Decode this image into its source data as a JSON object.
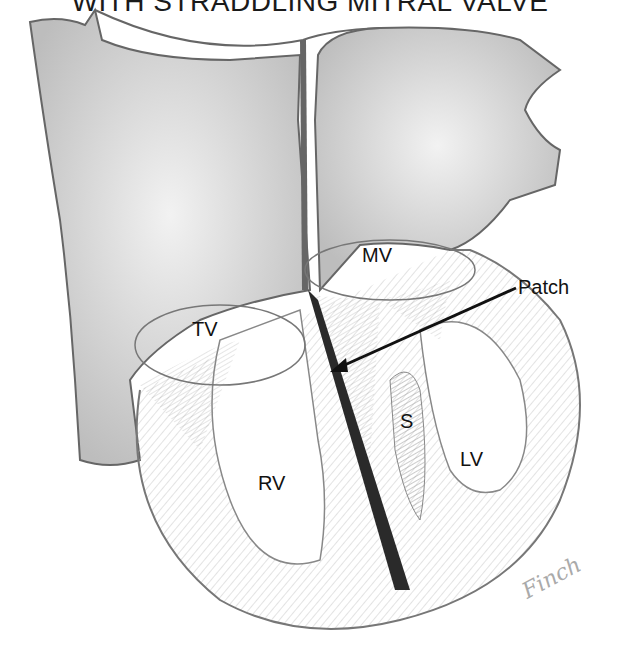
{
  "title": "WITH STRADDLING MITRAL VALVE",
  "labels": {
    "mv": "MV",
    "tv": "TV",
    "patch": "Patch",
    "s": "S",
    "lv": "LV",
    "rv": "RV"
  },
  "signature": "Finch",
  "colors": {
    "line": "#555555",
    "shade": "#d9d9d9",
    "patch": "#2a2a2a",
    "arrow": "#111111"
  }
}
